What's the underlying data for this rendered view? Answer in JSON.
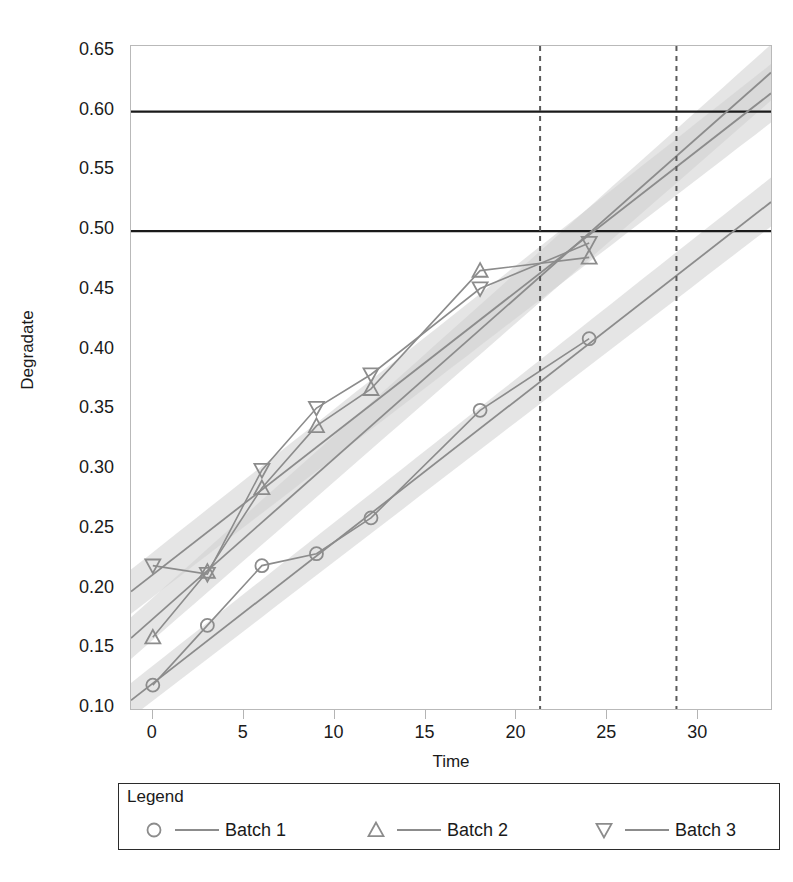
{
  "chart_data": {
    "type": "line",
    "title": "",
    "xlabel": "Time",
    "ylabel": "Degradate",
    "xlim": [
      -1.2,
      34.0
    ],
    "ylim": [
      0.1,
      0.655
    ],
    "xticks": [
      0,
      5,
      10,
      15,
      20,
      25,
      30
    ],
    "yticks": [
      0.1,
      0.15,
      0.2,
      0.25,
      0.3,
      0.35,
      0.4,
      0.45,
      0.5,
      0.55,
      0.6,
      0.65
    ],
    "ytick_labels": [
      "0.10",
      "0.15",
      "0.20",
      "0.25",
      "0.30",
      "0.35",
      "0.40",
      "0.45",
      "0.50",
      "0.55",
      "0.60",
      "0.65"
    ],
    "xtick_labels": [
      "0",
      "5",
      "10",
      "15",
      "20",
      "25",
      "30"
    ],
    "grid": false,
    "legend_position": "below-axes",
    "legend_title": "Legend",
    "series": [
      {
        "name": "Batch 1",
        "marker": "circle",
        "color": "#8c8c8c",
        "x": [
          0,
          3,
          6,
          9,
          12,
          18,
          24
        ],
        "y": [
          0.12,
          0.17,
          0.22,
          0.23,
          0.26,
          0.35,
          0.41
        ],
        "fit_intercept": 0.1215,
        "fit_slope": 0.01185,
        "band_halfwidth_at_0": 0.0145,
        "band_halfwidth_at_34": 0.0205
      },
      {
        "name": "Batch 2",
        "marker": "triangle-up",
        "color": "#8c8c8c",
        "x": [
          0,
          3,
          6,
          9,
          12,
          18,
          24
        ],
        "y": [
          0.16,
          0.215,
          0.285,
          0.337,
          0.368,
          0.467,
          0.478
        ],
        "fit_intercept": 0.1755,
        "fit_slope": 0.01345,
        "band_halfwidth_at_0": 0.0175,
        "band_halfwidth_at_34": 0.0235
      },
      {
        "name": "Batch 3",
        "marker": "triangle-down",
        "color": "#8c8c8c",
        "x": [
          0,
          3,
          6,
          9,
          12,
          18,
          24
        ],
        "y": [
          0.22,
          0.213,
          0.3,
          0.352,
          0.38,
          0.452,
          0.49
        ],
        "fit_intercept": 0.2125,
        "fit_slope": 0.01185,
        "band_halfwidth_at_0": 0.0185,
        "band_halfwidth_at_34": 0.0245
      }
    ],
    "reference_lines_horizontal": [
      {
        "value": 0.6,
        "label": "",
        "style": "solid",
        "color": "#1a1a1a"
      },
      {
        "value": 0.5,
        "label": "",
        "style": "solid",
        "color": "#1a1a1a"
      }
    ],
    "reference_lines_vertical": [
      {
        "value": 21.3,
        "label": "",
        "style": "dashed",
        "color": "#5a5a5a"
      },
      {
        "value": 28.8,
        "label": "",
        "style": "dashed",
        "color": "#5a5a5a"
      }
    ],
    "band_color": "#cfcfcf",
    "line_color": "#8c8c8c"
  },
  "axes": {
    "y_title": "Degradate",
    "x_title": "Time"
  },
  "legend": {
    "title": "Legend",
    "entries": [
      {
        "label": "Batch 1",
        "marker": "circle-icon"
      },
      {
        "label": "Batch 2",
        "marker": "triangle-up-icon"
      },
      {
        "label": "Batch 3",
        "marker": "triangle-down-icon"
      }
    ]
  },
  "caption": {
    "text": ""
  }
}
